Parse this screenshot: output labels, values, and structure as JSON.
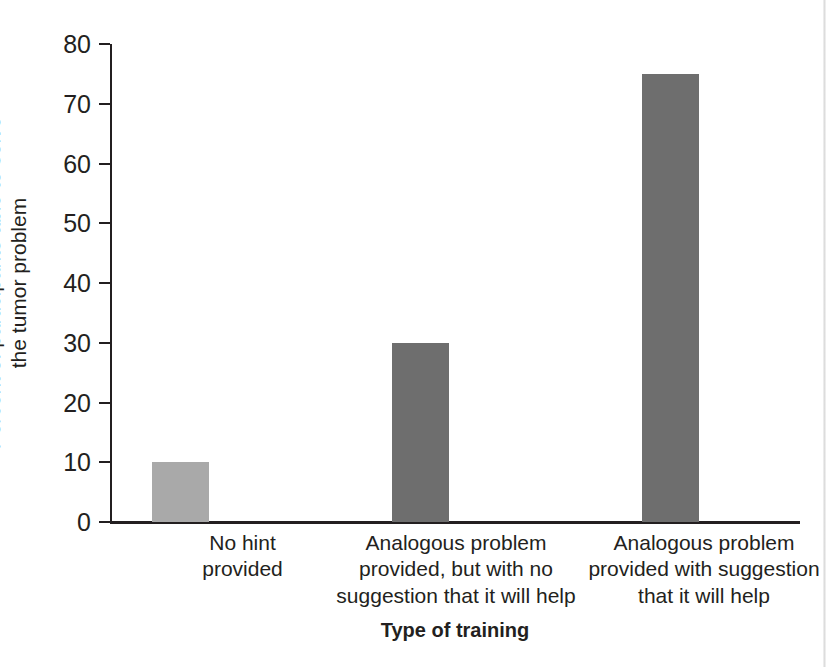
{
  "chart_data": {
    "type": "bar",
    "title": "",
    "xlabel": "Type of training",
    "ylabel_lines": [
      "Percent of participants able to solve",
      "the tumor problem"
    ],
    "ylabel": "Percent of participants able to solve the tumor problem",
    "categories": [
      "No hint provided",
      "Analogous problem provided, but with no suggestion that it will help",
      "Analogous problem provided with suggestion that it will help"
    ],
    "category_lines": [
      [
        "No hint",
        "provided"
      ],
      [
        "Analogous problem",
        "provided, but with no",
        "suggestion that it will help"
      ],
      [
        "Analogous problem",
        "provided with suggestion",
        "that it will help"
      ]
    ],
    "values": [
      10,
      30,
      75
    ],
    "ylim": [
      0,
      80
    ],
    "yticks": [
      0,
      10,
      20,
      30,
      40,
      50,
      60,
      70,
      80
    ],
    "ytick_labels": [
      "0",
      "10",
      "20",
      "30",
      "40",
      "50",
      "60",
      "70",
      "80"
    ],
    "grid": false,
    "legend": false,
    "bar_colors": [
      "#a9a9a9",
      "#6e6e6e",
      "#6e6e6e"
    ],
    "axis_color": "#231f20",
    "background": "#ffffff",
    "bar_geometry": [
      {
        "center_pct": 10.2,
        "width_px": 57
      },
      {
        "center_pct": 45.0,
        "width_px": 57
      },
      {
        "center_pct": 81.2,
        "width_px": 57
      }
    ],
    "category_label_geometry": [
      {
        "left_px": 70,
        "width_px": 125
      },
      {
        "left_px": 222,
        "width_px": 248
      },
      {
        "left_px": 470,
        "width_px": 248
      }
    ]
  }
}
